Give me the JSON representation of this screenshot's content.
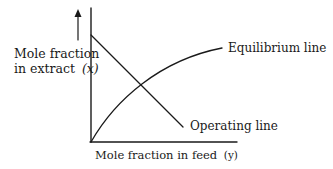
{
  "diagram": {
    "y_axis_label_line1": "Mole fraction",
    "y_axis_label_line2": "in extract",
    "y_axis_var": "(x)",
    "x_axis_label": "Mole fraction in feed",
    "x_axis_var": "(y)",
    "equilibrium_label": "Equilibrium line",
    "operating_label": "Operating line",
    "colors": {
      "ink": "#1a1a1a",
      "background": "#ffffff"
    }
  }
}
